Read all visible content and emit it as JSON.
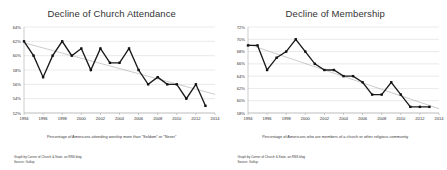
{
  "page": {
    "background_color": "#ffffff",
    "layout": "two-charts-side-by-side"
  },
  "charts": [
    {
      "id": "church-attendance",
      "title": "Decline of Church Attendance",
      "subtitle": "Percentage of Americans attending worship more than \"Seldom\" or \"Never\"",
      "credit_line1": "Graph by Corner of Church & State, an RNS blog",
      "credit_line2": "Source: Gallup",
      "line_color": "#1a1a1a",
      "trend_color": "#8d8d8d",
      "grid_color": "#c9c9c9"
    },
    {
      "id": "membership",
      "title": "Decline of Membership",
      "subtitle": "Percentage of Americans who are members of a church or other religious community",
      "credit_line1": "Graph by Corner of Church & State, an RNS blog",
      "credit_line2": "Source: Gallup",
      "line_color": "#1a1a1a",
      "trend_color": "#8d8d8d",
      "grid_color": "#c9c9c9"
    }
  ],
  "chart_data": [
    {
      "type": "line",
      "title": "Decline of Church Attendance",
      "subtitle": "Percentage of Americans attending worship more than \"Seldom\" or \"Never\"",
      "xlabel": "",
      "ylabel": "",
      "grid": true,
      "legend": "none",
      "xlim": [
        1994,
        2014
      ],
      "ylim": [
        52,
        64
      ],
      "ytick_labels": [
        "52%",
        "54%",
        "56%",
        "58%",
        "60%",
        "62%",
        "64%"
      ],
      "yticks": [
        52,
        54,
        56,
        58,
        60,
        62,
        64
      ],
      "xtick_labels": [
        "1994",
        "1996",
        "1998",
        "2000",
        "2002",
        "2004",
        "2006",
        "2008",
        "2010",
        "2012",
        "2014"
      ],
      "xticks": [
        1994,
        1996,
        1998,
        2000,
        2002,
        2004,
        2006,
        2008,
        2010,
        2012,
        2014
      ],
      "x": [
        1994,
        1995,
        1996,
        1997,
        1998,
        1999,
        2000,
        2001,
        2002,
        2003,
        2004,
        2005,
        2006,
        2007,
        2008,
        2009,
        2010,
        2011,
        2012,
        2013
      ],
      "values": [
        62,
        60,
        57,
        60,
        62,
        60,
        61,
        58,
        61,
        59,
        59,
        61,
        58,
        56,
        57,
        56,
        56,
        54,
        56,
        53
      ],
      "series": [
        {
          "name": "Percentage attending worship more than Seldom/Never",
          "values": [
            62,
            60,
            57,
            60,
            62,
            60,
            61,
            58,
            61,
            59,
            59,
            61,
            58,
            56,
            57,
            56,
            56,
            54,
            56,
            53
          ]
        }
      ],
      "trend": {
        "type": "linear",
        "start": [
          1994,
          61.8
        ],
        "end": [
          2014,
          54.6
        ]
      }
    },
    {
      "type": "line",
      "title": "Decline of Membership",
      "subtitle": "Percentage of Americans who are members of a church or other religious community",
      "xlabel": "",
      "ylabel": "",
      "grid": true,
      "legend": "none",
      "xlim": [
        1994,
        2014
      ],
      "ylim": [
        58,
        72
      ],
      "ytick_labels": [
        "58%",
        "60%",
        "62%",
        "64%",
        "66%",
        "68%",
        "70%",
        "72%"
      ],
      "yticks": [
        58,
        60,
        62,
        64,
        66,
        68,
        70,
        72
      ],
      "xtick_labels": [
        "1994",
        "1996",
        "1998",
        "2000",
        "2002",
        "2004",
        "2006",
        "2008",
        "2010",
        "2012",
        "2014"
      ],
      "xticks": [
        1994,
        1996,
        1998,
        2000,
        2002,
        2004,
        2006,
        2008,
        2010,
        2012,
        2014
      ],
      "x": [
        1994,
        1995,
        1996,
        1997,
        1998,
        1999,
        2000,
        2001,
        2002,
        2003,
        2004,
        2005,
        2006,
        2007,
        2008,
        2009,
        2010,
        2011,
        2012,
        2013
      ],
      "values": [
        69,
        69,
        65,
        67,
        68,
        70,
        68,
        66,
        65,
        65,
        64,
        64,
        63,
        61,
        61,
        63,
        61,
        59,
        59,
        59
      ],
      "series": [
        {
          "name": "Percentage who are members of a church or other religious community",
          "values": [
            69,
            69,
            65,
            67,
            68,
            70,
            68,
            66,
            65,
            65,
            64,
            64,
            63,
            61,
            61,
            63,
            61,
            59,
            59,
            59
          ]
        }
      ],
      "trend": {
        "type": "linear",
        "start": [
          1994,
          69.2
        ],
        "end": [
          2014,
          58.7
        ]
      }
    }
  ]
}
